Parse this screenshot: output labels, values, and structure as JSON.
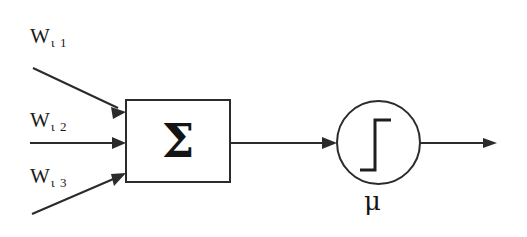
{
  "figure": {
    "kind": "artificial-neuron-schematic",
    "background_color": "#ffffff",
    "ink_color": "#2b2b2b"
  },
  "inputs": [
    {
      "id": "w-i1",
      "label_base": "W",
      "label_subscript": "ι 1",
      "icon": "diagonal-input-arrow-icon"
    },
    {
      "id": "w-i2",
      "label_base": "W",
      "label_subscript": "ι 2",
      "icon": "horizontal-input-arrow-icon"
    },
    {
      "id": "w-i3",
      "label_base": "W",
      "label_subscript": "ι 3",
      "icon": "diagonal-input-arrow-icon"
    }
  ],
  "summation": {
    "symbol": "Σ",
    "shape": "rectangle"
  },
  "activation": {
    "shape": "circle",
    "glyph": "step-function-icon",
    "label": "μ"
  },
  "connections": {
    "sum_to_activation": "arrow",
    "output": "arrow"
  }
}
